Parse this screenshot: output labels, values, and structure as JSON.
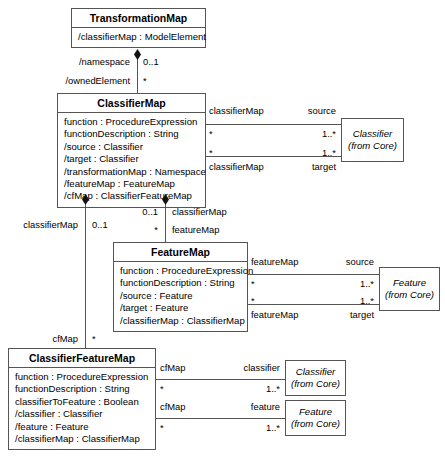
{
  "diagram": {
    "classes": {
      "transformation_map": {
        "name": "TransformationMap",
        "attributes": [
          "/classifierMap : ModelElement"
        ]
      },
      "classifier_map": {
        "name": "ClassifierMap",
        "attributes": [
          "function : ProcedureExpression",
          "functionDescription : String",
          "/source : Classifier",
          "/target : Classifier",
          "/transformationMap : Namespace",
          "/featureMap : FeatureMap",
          "/cfMap : ClassifierFeatureMap"
        ]
      },
      "feature_map": {
        "name": "FeatureMap",
        "attributes": [
          "function : ProcedureExpression",
          "functionDescription : String",
          "/source : Feature",
          "/target : Feature",
          "/classifierMap : ClassifierMap"
        ]
      },
      "classifier_feature_map": {
        "name": "ClassifierFeatureMap",
        "attributes": [
          "function : ProcedureExpression",
          "functionDescription : String",
          "classifierToFeature : Boolean",
          "/classifier : Classifier",
          "/feature : Feature",
          "/classifierMap : ClassifierMap"
        ]
      },
      "classifier_core_top": {
        "name": "Classifier",
        "origin": "(from Core)"
      },
      "feature_core_mid": {
        "name": "Feature",
        "origin": "(from Core)"
      },
      "classifier_core_bottom": {
        "name": "Classifier",
        "origin": "(from Core)"
      },
      "feature_core_bottom": {
        "name": "Feature",
        "origin": "(from Core)"
      }
    },
    "associations": {
      "tm_namespace": {
        "role": "/namespace",
        "multiplicity": "0..1"
      },
      "tm_ownedelement": {
        "role": "/ownedElement",
        "multiplicity": "*"
      },
      "cm_source_role": {
        "role": "classifierMap",
        "end": "source",
        "mult_near": "*",
        "mult_far": "1..*"
      },
      "cm_target_role": {
        "role": "classifierMap",
        "end": "target",
        "mult_near": "*",
        "mult_far": "1..*"
      },
      "cm_fm_owner": {
        "role": "classifierMap",
        "multiplicity": "0..1"
      },
      "cm_fm_child": {
        "role": "featureMap",
        "multiplicity": "*"
      },
      "cm_cf_owner": {
        "role": "classifierMap",
        "multiplicity": "0..1"
      },
      "cm_cf_child": {
        "role": "cfMap",
        "multiplicity": "*"
      },
      "fm_source_role": {
        "role": "featureMap",
        "end": "source",
        "mult_near": "*",
        "mult_far": "1..*"
      },
      "fm_target_role": {
        "role": "featureMap",
        "end": "target",
        "mult_near": "*",
        "mult_far": "1..*"
      },
      "cf_classifier": {
        "role": "cfMap",
        "end": "classifier",
        "mult_near": "*",
        "mult_far": "1..*"
      },
      "cf_feature": {
        "role": "cfMap",
        "end": "feature",
        "mult_near": "*",
        "mult_far": "1..*"
      }
    }
  }
}
